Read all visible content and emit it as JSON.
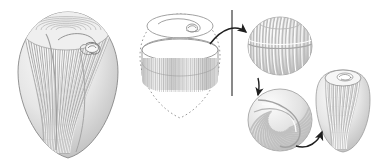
{
  "figure": {
    "background_color": "#ffffff",
    "width": 382,
    "height": 167,
    "line_color": "#2b2b2b",
    "stripe_light": "#f2f2f2",
    "stripe_mid": "#d0d0d0",
    "stripe_dark": "#a8a8a8",
    "body_fill": "#e9e9e9",
    "shadow_color": "#b5b5b5"
  },
  "panels": [
    {
      "id": "panel-a",
      "name": "whole-cell-ciliate",
      "label": "",
      "description": "Shaded teardrop ciliate cell with longitudinal kineties and marginal cilia, apical oral spiral",
      "center_x": 68,
      "center_y": 86,
      "width": 105,
      "height": 150,
      "features": [
        "longitudinal-ribs",
        "marginal-cilia",
        "oral-spiral",
        "apical-dome"
      ],
      "rib_count": 34,
      "cilia_count": 120
    },
    {
      "id": "panel-b",
      "name": "ghost-outline-with-band",
      "label": "",
      "description": "Dotted teardrop ghost outline with apical ellipse containing oral spiral and an equatorial striped band",
      "center_x": 180,
      "center_y": 62,
      "width": 80,
      "height": 100,
      "features": [
        "dotted-outline",
        "apical-ellipse",
        "oral-spiral",
        "equatorial-striped-band"
      ],
      "band_stripe_count": 40
    },
    {
      "id": "panel-c",
      "name": "rounded-barrel-stage",
      "label": "",
      "description": "Rounded barrel-shaped stage with vertical ribbing and equatorial constriction",
      "center_x": 280,
      "center_y": 46,
      "width": 64,
      "height": 58,
      "features": [
        "vertical-ribs",
        "equatorial-groove"
      ],
      "rib_count": 20
    },
    {
      "id": "panel-d",
      "name": "spiralled-round-stage",
      "label": "",
      "description": "Round stage with swirling spiral ribbing indicating oral primordium rotation",
      "center_x": 280,
      "center_y": 120,
      "width": 64,
      "height": 62,
      "features": [
        "spiral-ribs",
        "oral-primordium"
      ],
      "rib_count": 22
    },
    {
      "id": "panel-e",
      "name": "reformed-cell-stage",
      "label": "",
      "description": "Reformed elongated teardrop cell with vertical ribs and small apical oral opening",
      "center_x": 343,
      "center_y": 110,
      "width": 54,
      "height": 82,
      "features": [
        "vertical-ribs",
        "apical-opening",
        "oral-spiral"
      ],
      "rib_count": 18
    }
  ],
  "connectors": [
    {
      "id": "arrow-1",
      "name": "arrow-band-to-barrel",
      "type": "curved-arrow",
      "from_panel": "panel-b",
      "to_panel": "panel-c",
      "direction": "right",
      "crosses_divider": true
    },
    {
      "id": "arrow-2",
      "name": "arrow-barrel-to-spiral",
      "type": "curved-arrow",
      "from_panel": "panel-c",
      "to_panel": "panel-d",
      "direction": "down",
      "crosses_divider": false
    },
    {
      "id": "arrow-3",
      "name": "arrow-spiral-to-reformed",
      "type": "curved-arrow",
      "from_panel": "panel-d",
      "to_panel": "panel-e",
      "direction": "up-right",
      "crosses_divider": false
    }
  ],
  "divider": {
    "name": "vertical-divider-line",
    "x": 232,
    "y_top": 10,
    "y_bottom": 96,
    "color": "#4a4a4a"
  }
}
